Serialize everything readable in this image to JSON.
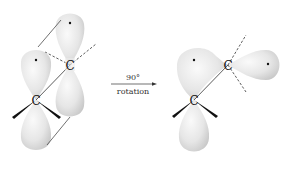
{
  "diagram": {
    "title": "",
    "colors": {
      "lobe_fill_light": "#f2f2f2",
      "lobe_fill_dark": "#cfcfcf",
      "line": "#333333",
      "background": "#ffffff"
    },
    "arrow": {
      "label_top": "90°",
      "label_bottom": "rotation"
    },
    "left_molecule": {
      "atoms": [
        {
          "label": "C",
          "role": "upper-carbon"
        },
        {
          "label": "C",
          "role": "lower-carbon"
        }
      ],
      "description": "Two parallel p orbitals, each with one electron (dot)"
    },
    "right_molecule": {
      "atoms": [
        {
          "label": "C",
          "role": "upper-carbon"
        },
        {
          "label": "C",
          "role": "lower-carbon"
        }
      ],
      "description": "After 90° rotation, p orbitals are perpendicular, each with one electron (dot)"
    }
  }
}
